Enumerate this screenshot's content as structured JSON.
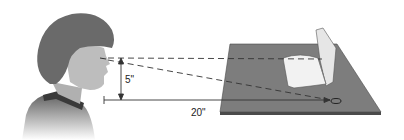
{
  "diagram": {
    "labels": {
      "height": "5\"",
      "distance": "20\""
    },
    "colors": {
      "hair": "#6a6a6a",
      "skin": "#b8b8b8",
      "shirt": "#5a5a5a",
      "collar": "#3a3a3a",
      "table_top": "#7d7d7d",
      "table_edge": "#4a4a4a",
      "book": "#ececec",
      "lines": "#333333"
    }
  }
}
